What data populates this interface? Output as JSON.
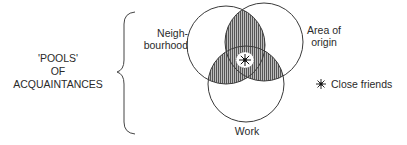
{
  "title_group": {
    "lines": [
      "'POOLS'",
      "OF",
      "ACQUAINTANCES"
    ]
  },
  "circles": [
    {
      "id": "neighbourhood",
      "label_lines": [
        "Neigh-",
        "bourhood"
      ],
      "cx": 226,
      "cy": 45,
      "r": 39
    },
    {
      "id": "area-of-origin",
      "label_lines": [
        "Area of",
        "origin"
      ],
      "cx": 264,
      "cy": 42,
      "r": 39
    },
    {
      "id": "work",
      "label_lines": [
        "Work"
      ],
      "cx": 246,
      "cy": 84,
      "r": 38
    }
  ],
  "legend": {
    "symbol": "asterisk-star",
    "label": "Close friends"
  },
  "colors": {
    "line": "#3a3a3a",
    "hatch": "#555555",
    "background": "#ffffff"
  }
}
